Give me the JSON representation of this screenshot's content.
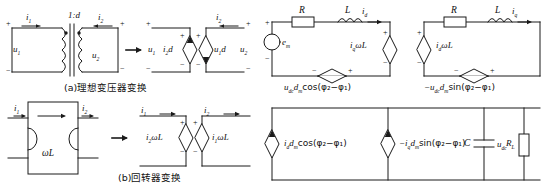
{
  "figure": {
    "captions": [
      {
        "id": "a",
        "text": "(a)理想变压器变换"
      },
      {
        "id": "b",
        "text": "(b)回转器变换"
      }
    ]
  },
  "panel_a": {
    "name": "ideal-transformer-transformation",
    "source_circuit": {
      "ratio_label": "1:d",
      "current_in": "i",
      "current_in_sub": "1",
      "current_out": "i",
      "current_out_sub": "2",
      "voltage_in": "u",
      "voltage_in_sub": "1",
      "voltage_out": "u",
      "voltage_out_sub": "2",
      "polarity_plus": "+",
      "polarity_minus": "−"
    },
    "equivalent_circuit": {
      "left_source_label": "i",
      "left_source_sub": "2",
      "left_source_tail": "d",
      "right_source_label": "u",
      "right_source_sub": "1",
      "right_source_tail": "d",
      "port_voltage_left": "u",
      "port_voltage_left_sub": "1",
      "port_voltage_right": "u",
      "port_voltage_right_sub": "2",
      "current_label": "i",
      "current_sub": "2"
    },
    "arrow": "→"
  },
  "panel_b": {
    "name": "gyrator-transformation",
    "source_circuit": {
      "box_label": "ωL",
      "current_in": "i",
      "current_in_sub": "1",
      "current_out": "i",
      "current_out_sub": "2"
    },
    "equivalent_circuit": {
      "left_source_label": "i",
      "left_source_sub": "2",
      "left_source_tail": "ωL",
      "right_source_label": "i",
      "right_source_sub": "1",
      "right_source_tail": "ωL",
      "current_left": "i",
      "current_left_sub": "1",
      "current_right": "i",
      "current_right_sub": "2",
      "polarity_plus": "+",
      "polarity_minus": "−"
    },
    "arrow": "→"
  },
  "panel_d_axis": {
    "name": "d-axis-equivalent-circuit",
    "resistor": "R",
    "inductor": "L",
    "current": "i",
    "current_sub": "d",
    "source": "e",
    "source_sub": "m",
    "dependent_voltage_source": "i",
    "dependent_voltage_source_sub": "q",
    "dependent_voltage_source_tail": "ωL",
    "bottom_source": "u",
    "bottom_source_sub": "dc",
    "bottom_source_mid": "d",
    "bottom_source_mid_sub": "m",
    "bottom_source_expr": "cos(φ₂−φ₁)",
    "polarity_plus": "+",
    "polarity_minus": "−"
  },
  "panel_q_axis": {
    "name": "q-axis-equivalent-circuit",
    "resistor": "R",
    "inductor": "L",
    "current": "i",
    "current_sub": "q",
    "dependent_voltage_source": "i",
    "dependent_voltage_source_sub": "d",
    "dependent_voltage_source_tail": "ωL",
    "bottom_source_sign": "−",
    "bottom_source": "u",
    "bottom_source_sub": "dc",
    "bottom_source_mid": "d",
    "bottom_source_mid_sub": "m",
    "bottom_source_expr": "sin(φ₂−φ₁)",
    "polarity_plus": "+",
    "polarity_minus": "−"
  },
  "panel_dc": {
    "name": "dc-side-equivalent-circuit",
    "source1": "i",
    "source1_sub": "d",
    "source1_mid": "d",
    "source1_mid_sub": "m",
    "source1_expr": "cos(φ₂−φ₁)",
    "source2_sign": "−",
    "source2": "i",
    "source2_sub": "q",
    "source2_mid": "d",
    "source2_mid_sub": "m",
    "source2_expr": "sin(φ₂−φ₁)",
    "capacitor": "C",
    "capacitor_voltage": "u",
    "capacitor_voltage_sub": "dc",
    "load": "R",
    "load_sub": "L"
  },
  "colors": {
    "line": "#1a1a1a",
    "text": "#111111",
    "background": "#ffffff"
  }
}
